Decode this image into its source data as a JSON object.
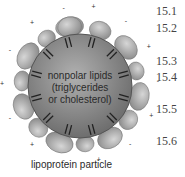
{
  "diagram": {
    "core_label_lines": [
      "nonpolar lipids",
      "(triglycerides",
      "or cholesterol)"
    ],
    "caption": "lipoprotein particle",
    "charge_symbols": [
      "+",
      "-"
    ],
    "colors": {
      "core": "#8a8a8a",
      "protein": "#b8b8b8",
      "tails": "#222222"
    }
  },
  "margin_numbers": [
    "15.1",
    "15.2",
    "15.3",
    "15.4",
    "15.5",
    "15.6"
  ]
}
